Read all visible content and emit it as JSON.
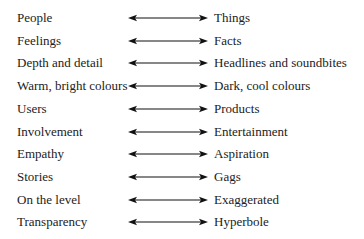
{
  "diagram": {
    "rows": [
      {
        "left": "People",
        "right": "Things"
      },
      {
        "left": "Feelings",
        "right": "Facts"
      },
      {
        "left": "Depth and detail",
        "right": "Headlines and soundbites"
      },
      {
        "left": "Warm, bright colours",
        "right": "Dark, cool colours"
      },
      {
        "left": "Users",
        "right": "Products"
      },
      {
        "left": "Involvement",
        "right": "Entertainment"
      },
      {
        "left": "Empathy",
        "right": "Aspiration"
      },
      {
        "left": "Stories",
        "right": "Gags"
      },
      {
        "left": "On the level",
        "right": "Exaggerated"
      },
      {
        "left": "Transparency",
        "right": "Hyperbole"
      }
    ],
    "arrow_icon": "double-headed-arrow-icon"
  }
}
